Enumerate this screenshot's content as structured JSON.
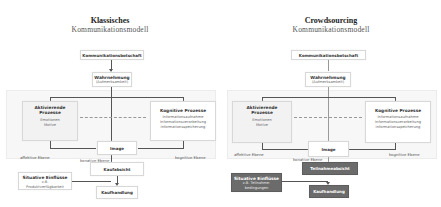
{
  "left": {
    "title_line1": "Klassisches",
    "title_line2": "Kommunikationsmodell",
    "box_kommunikation": "Kommunikationsbotschaft",
    "box_wahrnehmung_title": "Wahrnehmung",
    "box_wahrnehmung_sub": "(Aufmerksamkeit)",
    "box_aktivierend_title": "Aktivierende Prozesse",
    "box_aktivierend_items": [
      "Emotionen",
      "Motive"
    ],
    "box_kognitiv_title": "Kognitive Prozesse",
    "box_kognitiv_items": [
      "Informationsaufnahme",
      "Informationsverarbeitung",
      "Informationsspeicherung"
    ],
    "box_image": "Image",
    "label_affektiv": "affektive Ebene",
    "label_kognitiv": "kognitive Ebene",
    "label_konativ": "konative Ebene",
    "box_kaufabsicht": "Kaufabsicht",
    "box_situativ_title": "Situative Einflüsse",
    "box_situativ_sub1": "z.B.",
    "box_situativ_sub2": "Produktverfügbarkeit",
    "box_kaufhandlung": "Kaufhandlung"
  },
  "right": {
    "title_line1": "Crowdsourcing",
    "title_line2": "Kommunikationsmodell",
    "box_kommunikation": "Kommunikationsbotschaft",
    "box_wahrnehmung_title": "Wahrnehmung",
    "box_wahrnehmung_sub": "(Aufmerksamkeit)",
    "box_aktivierend_title": "Aktivierende Prozesse",
    "box_aktivierend_items": [
      "Emotionen",
      "Motive"
    ],
    "box_kognitiv_title": "Kognitive Prozesse",
    "box_kognitiv_items": [
      "Informationsaufnahme",
      "Informationsverarbeitung",
      "Informationsspeicherung"
    ],
    "box_image": "Image",
    "label_affektiv": "affektive Ebene",
    "label_kognitiv": "kognitive Ebene",
    "label_konativ": "konative Ebene",
    "box_kaufabsicht": "Teilnahmeabsicht",
    "box_situativ_title": "Situative Einflüsse",
    "box_situativ_sub1": "z.B. Teilnahme-",
    "box_situativ_sub2": "bedingungen",
    "box_kaufhandlung": "Kaufhandlung"
  },
  "colors": {
    "highlight_box": "#6b6b6b",
    "zone_bg": "#f7f7f7",
    "line": "#555555"
  }
}
